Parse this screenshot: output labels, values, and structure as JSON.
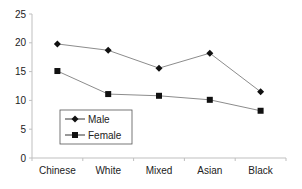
{
  "chart_data": {
    "type": "line",
    "title": "",
    "xlabel": "",
    "ylabel": "",
    "categories": [
      "Chinese",
      "White",
      "Mixed",
      "Asian",
      "Black"
    ],
    "series": [
      {
        "name": "Male",
        "marker": "diamond",
        "values": [
          19.8,
          18.7,
          15.6,
          18.2,
          11.5
        ]
      },
      {
        "name": "Female",
        "marker": "square",
        "values": [
          15.1,
          11.1,
          10.8,
          10.1,
          8.2
        ]
      }
    ],
    "ylim": [
      0,
      25
    ],
    "yticks": [
      0,
      5,
      10,
      15,
      20,
      25
    ],
    "grid": false,
    "legend_position": "inside-lower-left",
    "colors": {
      "line": "#8c8c8c",
      "marker": "#111111",
      "axis": "#bfbfbf",
      "text": "#222222"
    }
  }
}
